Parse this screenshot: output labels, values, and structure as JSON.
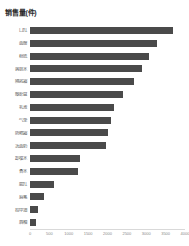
{
  "chart_data": {
    "type": "bar",
    "orientation": "horizontal",
    "title": "销售量(件)",
    "xlabel": "",
    "ylabel": "",
    "grid": false,
    "legend": false,
    "xlim": [
      0,
      4000
    ],
    "xticks": [
      0,
      500,
      1000,
      1500,
      2000,
      2500,
      3000,
      3500,
      4000
    ],
    "bar_color": "#4a4a4a",
    "categories": [
      "口红",
      "面膜",
      "粉底",
      "爽肤水",
      "隔离霜",
      "眼影盘",
      "乳液",
      "气垫",
      "防晒霜",
      "洗面奶",
      "卸妆水",
      "香水",
      "腮红",
      "眉笔",
      "指甲油",
      "唇釉"
    ],
    "values": [
      3680,
      3280,
      3080,
      2900,
      2680,
      2400,
      2180,
      2080,
      2000,
      1960,
      1280,
      1240,
      620,
      360,
      200,
      160
    ]
  }
}
